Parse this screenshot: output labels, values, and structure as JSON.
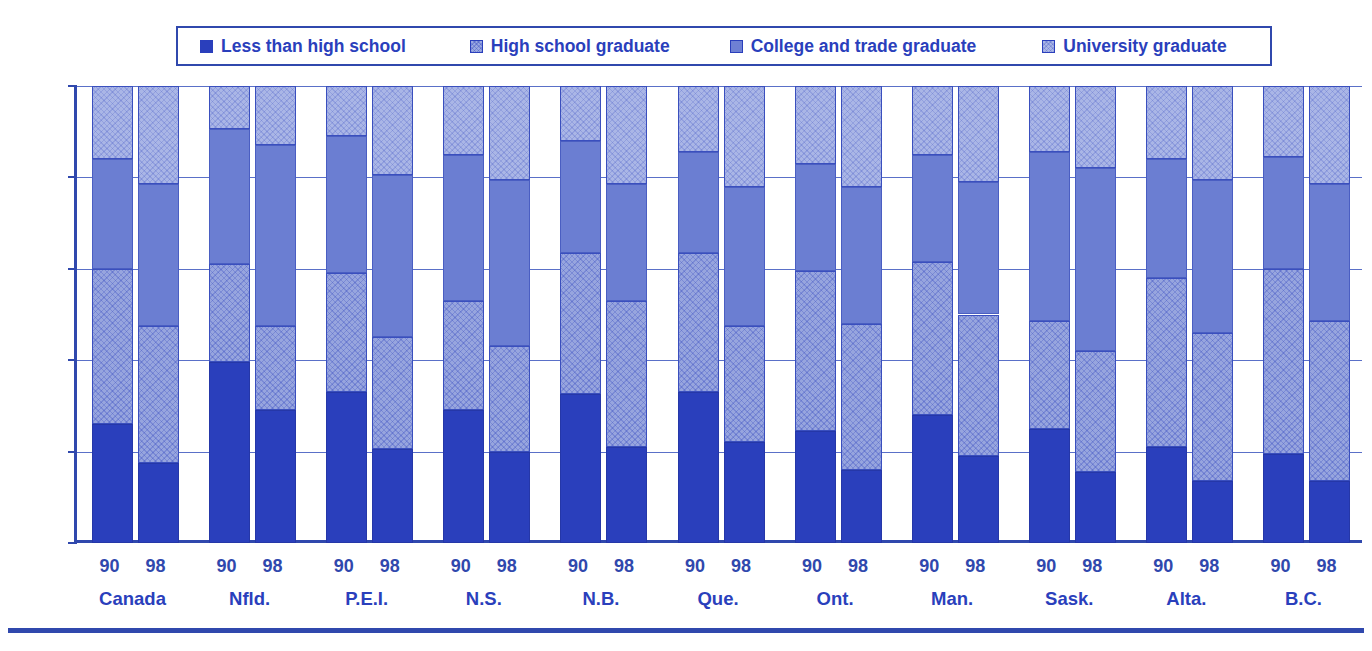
{
  "legend": {
    "items": [
      {
        "label": "Less than high school",
        "key": "lths",
        "color": "#2a3fbc",
        "icon": "square-swatch-icon"
      },
      {
        "label": "High school graduate",
        "key": "hsg",
        "color": "#97a5de",
        "icon": "square-swatch-icon"
      },
      {
        "label": "College and trade graduate",
        "key": "ctg",
        "color": "#6b7ed2",
        "icon": "square-swatch-icon"
      },
      {
        "label": "University graduate",
        "key": "ug",
        "color": "#aab6e6",
        "icon": "square-swatch-icon"
      }
    ]
  },
  "axis": {
    "y_ticks": [
      "0%",
      "20%",
      "40%",
      "60%",
      "80%",
      "100%"
    ],
    "y_values": [
      0,
      20,
      40,
      60,
      80,
      100
    ]
  },
  "chart_data": {
    "type": "bar",
    "title": "",
    "xlabel": "",
    "ylabel": "",
    "ylim": [
      0,
      100
    ],
    "grid": true,
    "stacked": true,
    "legend_position": "top",
    "categories": [
      "Canada",
      "Nfld.",
      "P.E.I.",
      "N.S.",
      "N.B.",
      "Que.",
      "Ont.",
      "Man.",
      "Sask.",
      "Alta.",
      "B.C."
    ],
    "subcategories": [
      "90",
      "98"
    ],
    "series": [
      {
        "name": "Less than high school",
        "color": "#2a3fbc",
        "values_90": [
          26.0,
          39.5,
          33.0,
          29.0,
          32.5,
          33.0,
          24.5,
          28.0,
          25.0,
          21.0,
          19.5
        ],
        "values_98": [
          17.5,
          29.0,
          20.5,
          20.0,
          21.0,
          22.0,
          16.0,
          19.0,
          15.5,
          13.5,
          13.5
        ]
      },
      {
        "name": "High school graduate",
        "color": "#97a5de",
        "values_90": [
          34.0,
          21.5,
          26.0,
          24.0,
          31.0,
          30.5,
          35.0,
          33.5,
          23.5,
          37.0,
          40.5
        ],
        "values_98": [
          30.0,
          18.5,
          24.5,
          23.0,
          32.0,
          25.5,
          32.0,
          31.0,
          26.5,
          32.5,
          35.0
        ]
      },
      {
        "name": "College and trade graduate",
        "color": "#6b7ed2",
        "values_90": [
          24.0,
          29.5,
          30.0,
          32.0,
          24.5,
          22.0,
          23.5,
          23.5,
          37.0,
          26.0,
          24.5
        ],
        "values_98": [
          31.0,
          39.5,
          35.5,
          36.5,
          25.5,
          30.5,
          30.0,
          29.0,
          40.0,
          33.5,
          30.0
        ]
      },
      {
        "name": "University graduate",
        "color": "#aab6e6",
        "values_90": [
          16.0,
          9.5,
          11.0,
          15.0,
          12.0,
          14.5,
          17.0,
          15.0,
          14.5,
          16.0,
          15.5
        ],
        "values_98": [
          21.5,
          13.0,
          19.5,
          20.5,
          21.5,
          22.0,
          22.0,
          21.0,
          18.0,
          20.5,
          21.5
        ]
      }
    ]
  }
}
